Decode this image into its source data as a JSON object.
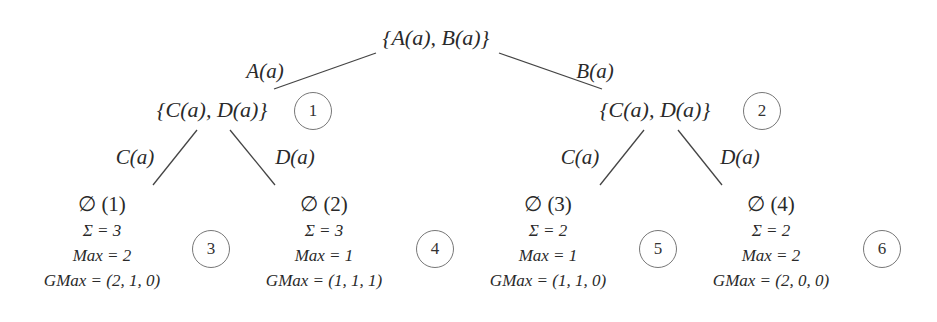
{
  "root": {
    "label": "{A(a), B(a)}"
  },
  "edges_level1": [
    {
      "label": "A(a)"
    },
    {
      "label": "B(a)"
    }
  ],
  "level1": [
    {
      "label": "{C(a), D(a)}",
      "circle": "1"
    },
    {
      "label": "{C(a), D(a)}",
      "circle": "2"
    }
  ],
  "edges_level2": [
    {
      "label": "C(a)"
    },
    {
      "label": "D(a)"
    },
    {
      "label": "C(a)"
    },
    {
      "label": "D(a)"
    }
  ],
  "leaves": [
    {
      "title": "∅ (1)",
      "sigma": "Σ = 3",
      "max": "Max = 2",
      "gmax": "GMax = (2, 1, 0)",
      "circle": "3"
    },
    {
      "title": "∅ (2)",
      "sigma": "Σ = 3",
      "max": "Max = 1",
      "gmax": "GMax = (1, 1, 1)",
      "circle": "4"
    },
    {
      "title": "∅ (3)",
      "sigma": "Σ = 2",
      "max": "Max = 1",
      "gmax": "GMax = (1, 1, 0)",
      "circle": "5"
    },
    {
      "title": "∅ (4)",
      "sigma": "Σ = 2",
      "max": "Max = 2",
      "gmax": "GMax = (2, 0, 0)",
      "circle": "6"
    }
  ]
}
